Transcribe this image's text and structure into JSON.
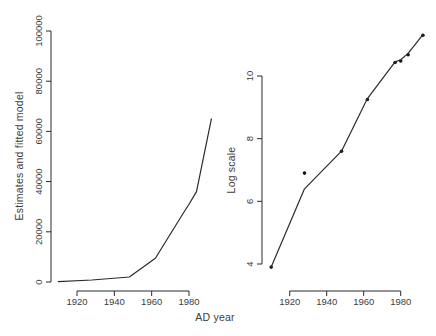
{
  "figure": {
    "xlabel": "AD year",
    "background_color": "#ffffff",
    "line_color": "#2b2b2b",
    "point_color": "#141414",
    "text_color": "#3d3d3d"
  },
  "chart_data": [
    {
      "type": "line",
      "panel": "left",
      "title": "",
      "xlabel": "AD year",
      "ylabel": "Estimates and fitted model",
      "xlim": [
        1908,
        1994
      ],
      "ylim": [
        0,
        100000
      ],
      "x_ticks": [
        1920,
        1940,
        1960,
        1980
      ],
      "y_ticks": [
        0,
        20000,
        40000,
        60000,
        80000,
        100000
      ],
      "grid": false,
      "legend": "none",
      "series": [
        {
          "name": "estimates-and-fitted-model",
          "kind": "line",
          "x": [
            1910,
            1928,
            1948,
            1962,
            1977,
            1980,
            1984,
            1992
          ],
          "y": [
            100,
            800,
            2000,
            9500,
            27500,
            31000,
            36000,
            65000
          ]
        }
      ]
    },
    {
      "type": "scatter",
      "panel": "right",
      "title": "",
      "xlabel": "AD year",
      "ylabel": "Log scale",
      "xlim": [
        1908,
        1994
      ],
      "ylim": [
        3.8,
        11.5
      ],
      "x_ticks": [
        1920,
        1940,
        1960,
        1980
      ],
      "y_ticks": [
        4,
        6,
        8,
        10
      ],
      "grid": false,
      "legend": "none",
      "series": [
        {
          "name": "log-estimates-points",
          "kind": "scatter",
          "x": [
            1910,
            1928,
            1948,
            1962,
            1977,
            1980,
            1984,
            1992
          ],
          "y": [
            3.9,
            6.9,
            7.6,
            9.25,
            10.43,
            10.48,
            10.68,
            11.3
          ]
        },
        {
          "name": "fitted-model-line",
          "kind": "line",
          "x": [
            1910,
            1928,
            1948,
            1962,
            1977,
            1980,
            1984,
            1992
          ],
          "y": [
            3.9,
            6.4,
            7.6,
            9.28,
            10.45,
            10.52,
            10.72,
            11.32
          ]
        }
      ]
    }
  ]
}
